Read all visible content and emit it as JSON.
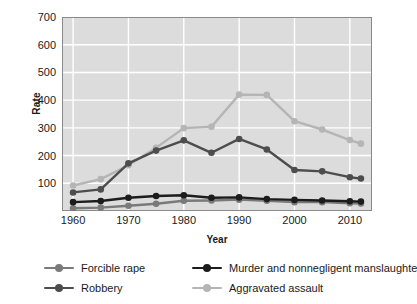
{
  "chart_data": {
    "type": "line",
    "title": "",
    "xlabel": "Year",
    "ylabel": "Rate",
    "grid": true,
    "legend_position": "bottom",
    "plot_background": "#dcdcdc",
    "grid_color": "#ffffff",
    "xlim": [
      1958,
      2014
    ],
    "ylim": [
      0,
      700
    ],
    "yticks": [
      100,
      200,
      300,
      400,
      500,
      600,
      700
    ],
    "xticks": [
      1960,
      1970,
      1980,
      1990,
      2000,
      2010
    ],
    "x": [
      1960,
      1965,
      1970,
      1975,
      1980,
      1985,
      1990,
      1995,
      2000,
      2005,
      2010,
      2012
    ],
    "series": [
      {
        "name": "Forcible rape",
        "color": "#7a7a7a",
        "values": [
          10,
          12,
          19,
          26,
          37,
          38,
          41,
          37,
          32,
          32,
          28,
          27
        ]
      },
      {
        "name": "Murder and nonnegligent manslaughter",
        "color": "#1c1c1c",
        "values": [
          32,
          36,
          48,
          54,
          57,
          48,
          49,
          43,
          40,
          38,
          35,
          34
        ]
      },
      {
        "name": "Robbery",
        "color": "#4d4d4d",
        "values": [
          67,
          78,
          172,
          218,
          255,
          210,
          260,
          222,
          148,
          143,
          122,
          117
        ]
      },
      {
        "name": "Aggravated assault",
        "color": "#b5b5b5",
        "values": [
          92,
          115,
          165,
          228,
          299,
          304,
          420,
          419,
          324,
          294,
          256,
          243
        ]
      }
    ]
  },
  "axis": {
    "ylabel": "Rate",
    "xlabel": "Year",
    "ytick_labels": [
      "700",
      "600",
      "500",
      "400",
      "300",
      "200",
      "100"
    ],
    "xtick_labels": [
      "1960",
      "1970",
      "1980",
      "1990",
      "2000",
      "2010"
    ]
  },
  "legend": {
    "items": [
      {
        "label": "Forcible rape",
        "color": "#7a7a7a"
      },
      {
        "label": "Murder and nonnegligent manslaughter",
        "color": "#1c1c1c"
      },
      {
        "label": "Robbery",
        "color": "#4d4d4d"
      },
      {
        "label": "Aggravated assault",
        "color": "#b5b5b5"
      }
    ]
  }
}
